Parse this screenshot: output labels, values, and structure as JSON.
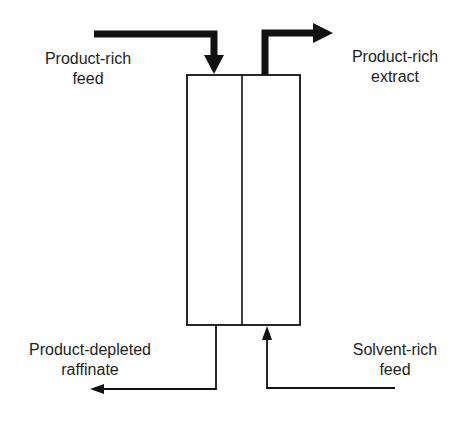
{
  "diagram": {
    "type": "countercurrent extraction column",
    "colors": {
      "line": "#111111",
      "background": "#ffffff"
    },
    "streams": {
      "product_rich_feed": {
        "line1": "Product-rich",
        "line2": "feed",
        "direction": "in",
        "position": "top-left"
      },
      "product_rich_extract": {
        "line1": "Product-rich",
        "line2": "extract",
        "direction": "out",
        "position": "top-right"
      },
      "product_depleted_raffinate": {
        "line1": "Product-depleted",
        "line2": "raffinate",
        "direction": "out",
        "position": "bottom-left"
      },
      "solvent_rich_feed": {
        "line1": "Solvent-rich",
        "line2": "feed",
        "direction": "in",
        "position": "bottom-right"
      }
    }
  }
}
